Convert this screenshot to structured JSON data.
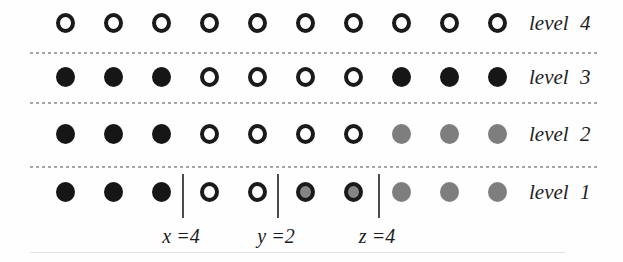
{
  "figure": {
    "rows": [
      {
        "label": "level 4",
        "dots": [
          "open",
          "open",
          "open",
          "open",
          "open",
          "open",
          "open",
          "open",
          "open",
          "open"
        ]
      },
      {
        "label": "level 3",
        "dots": [
          "black",
          "black",
          "black",
          "open",
          "open",
          "open",
          "open",
          "black",
          "black",
          "black"
        ]
      },
      {
        "label": "level 2",
        "dots": [
          "black",
          "black",
          "black",
          "open",
          "open",
          "open",
          "open",
          "gray",
          "gray",
          "gray"
        ]
      },
      {
        "label": "level 1",
        "dots": [
          "black",
          "black",
          "black",
          "open",
          "open",
          "grayring",
          "grayring",
          "gray",
          "gray",
          "gray"
        ]
      }
    ],
    "pointers": [
      {
        "variable": "x",
        "value": 4,
        "text": "x =4",
        "bar_after_column": 3
      },
      {
        "variable": "y",
        "value": 2,
        "text": "y =2",
        "bar_after_column": 5
      },
      {
        "variable": "z",
        "value": 4,
        "text": "z =4",
        "bar_after_column": 7
      }
    ],
    "colors": {
      "black": "#161616",
      "gray": "#7e7e7e",
      "ring": "#1a1a1a",
      "open_fill": "#ffffff",
      "grayring_fill": "#858585",
      "dashed_line": "#a6a6a6"
    }
  }
}
